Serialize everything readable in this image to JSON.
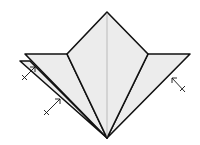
{
  "diagram": {
    "type": "origami-fold-step",
    "colors": {
      "paper": "#ececec",
      "line": "#111111",
      "crease": "#9a9a9a",
      "background": "#ffffff"
    },
    "arrows": [
      {
        "name": "fold-arrow-left-upper",
        "direction": "valley-fold-in"
      },
      {
        "name": "fold-arrow-left-lower",
        "direction": "valley-fold-in"
      },
      {
        "name": "fold-arrow-right",
        "direction": "valley-fold-in"
      }
    ]
  }
}
